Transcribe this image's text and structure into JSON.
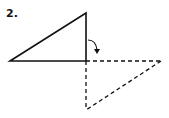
{
  "step": {
    "label": "2."
  },
  "diagram": {
    "solid_triangle": {
      "points": [
        [
          10,
          61
        ],
        [
          86,
          13
        ],
        [
          86,
          61
        ]
      ],
      "style": "solid"
    },
    "dashed_triangle": {
      "points": [
        [
          86,
          61
        ],
        [
          161,
          61
        ],
        [
          86,
          110
        ]
      ],
      "style": "dashed"
    },
    "fold_arrow": {
      "direction": "clockwise-down"
    },
    "colors": {
      "stroke": "#111111",
      "background": "#ffffff"
    }
  }
}
